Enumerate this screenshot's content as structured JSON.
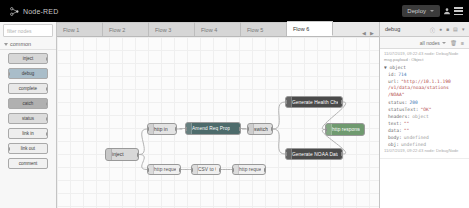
{
  "header": {
    "logo_text": "Node-RED",
    "logo_icon": "node-red-logo-icon",
    "deploy_label": "Deploy",
    "user_icon": "user-icon",
    "menu_icon": "hamburger-menu-icon",
    "background": "#000000"
  },
  "tabs": {
    "items": [
      {
        "label": "Flow 1",
        "active": false
      },
      {
        "label": "Flow 2",
        "active": false
      },
      {
        "label": "Flow 3",
        "active": false
      },
      {
        "label": "Flow 4",
        "active": false
      },
      {
        "label": "Flow 5",
        "active": false
      },
      {
        "label": "Flow 6",
        "active": true
      }
    ],
    "prev_arrow": "◀",
    "next_arrow": "▶"
  },
  "palette": {
    "search_placeholder": "filter nodes",
    "search_icon": "search-icon",
    "category": "common",
    "nodes": [
      {
        "label": "inject",
        "color": "#d7d7d7",
        "has_in": false,
        "has_out": true
      },
      {
        "label": "debug",
        "color": "#a9bdc9",
        "has_in": true,
        "has_out": false
      },
      {
        "label": "complete",
        "color": "#e8e8e8",
        "has_in": false,
        "has_out": true
      },
      {
        "label": "catch",
        "color": "#b0b0b0",
        "has_in": false,
        "has_out": true
      },
      {
        "label": "status",
        "color": "#dcdcdc",
        "has_in": false,
        "has_out": true
      },
      {
        "label": "link in",
        "color": "#eeeeee",
        "has_in": false,
        "has_out": true
      },
      {
        "label": "link out",
        "color": "#eeeeee",
        "has_in": true,
        "has_out": false
      },
      {
        "label": "comment",
        "color": "#f1f1f1",
        "has_in": false,
        "has_out": false
      }
    ]
  },
  "canvas": {
    "nodes": [
      {
        "id": "n1",
        "label": "inject",
        "x": 48,
        "y": 111,
        "w": 34,
        "h": 13,
        "color": "#d8d8d8",
        "text": "#333333",
        "in": false,
        "out": true
      },
      {
        "id": "n2",
        "label": "http in",
        "x": 90,
        "y": 86,
        "w": 30,
        "h": 12,
        "color": "#e3e3e3",
        "text": "#333333",
        "in": true,
        "out": true
      },
      {
        "id": "n3",
        "label": "Amend Req Prop",
        "x": 128,
        "y": 85,
        "w": 56,
        "h": 13,
        "color": "#4d6b6b",
        "text": "#ffffff",
        "in": true,
        "out": true
      },
      {
        "id": "n4",
        "label": "switch",
        "x": 190,
        "y": 86,
        "w": 26,
        "h": 12,
        "color": "#e0e0e0",
        "text": "#333333",
        "in": true,
        "out": true
      },
      {
        "id": "n5",
        "label": "Generate Health Check",
        "x": 228,
        "y": 59,
        "w": 58,
        "h": 12,
        "color": "#4a4a4a",
        "text": "#ffffff",
        "in": true,
        "out": true
      },
      {
        "id": "n6",
        "label": "Generate NOAA Dataset",
        "x": 228,
        "y": 111,
        "w": 58,
        "h": 12,
        "color": "#4a4a4a",
        "text": "#ffffff",
        "in": true,
        "out": true
      },
      {
        "id": "n7",
        "label": "http response",
        "x": 268,
        "y": 86,
        "w": 40,
        "h": 13,
        "color": "#6f9a6f",
        "text": "#ffffff",
        "in": true,
        "out": false
      },
      {
        "id": "n8",
        "label": "http request",
        "x": 90,
        "y": 127,
        "w": 34,
        "h": 11,
        "color": "#efefef",
        "text": "#555555",
        "in": true,
        "out": true
      },
      {
        "id": "n9",
        "label": "CSV to Obj",
        "x": 134,
        "y": 127,
        "w": 30,
        "h": 11,
        "color": "#efefef",
        "text": "#555555",
        "in": true,
        "out": true
      },
      {
        "id": "n10",
        "label": "http request",
        "x": 175,
        "y": 127,
        "w": 34,
        "h": 11,
        "color": "#efefef",
        "text": "#555555",
        "in": true,
        "out": true
      }
    ],
    "wires": [
      {
        "from": "n1",
        "to": "n2"
      },
      {
        "from": "n1",
        "to": "n8"
      },
      {
        "from": "n2",
        "to": "n3"
      },
      {
        "from": "n3",
        "to": "n4"
      },
      {
        "from": "n4",
        "to": "n5"
      },
      {
        "from": "n4",
        "to": "n6"
      },
      {
        "from": "n5",
        "to": "n7"
      },
      {
        "from": "n6",
        "to": "n7"
      },
      {
        "from": "n8",
        "to": "n9"
      },
      {
        "from": "n9",
        "to": "n10"
      }
    ]
  },
  "sidebar": {
    "tab_label": "debug",
    "tab_icons": [
      "info-icon",
      "debug-icon",
      "dashboard-icon",
      "config-icon",
      "more-icon"
    ],
    "toolbar": {
      "filter_label": "all nodes",
      "filter_icon": "chevron-down-icon",
      "clear_icon": "trash-icon",
      "collapse_icon": "collapse-icon"
    },
    "debug_messages": [
      {
        "timestamp": "11/07/2019, 09:22:43",
        "source_node": "node: DebugNode",
        "topic": "msg.payload : Object",
        "rows": [
          {
            "indent": 0,
            "key": "▼ object",
            "value": "",
            "type": "obj"
          },
          {
            "indent": 1,
            "key": "id:",
            "value": "714",
            "type": "num"
          },
          {
            "indent": 1,
            "key": "url:",
            "value": "\"http://10.1.1.190",
            "type": "str"
          },
          {
            "indent": 1,
            "key": "",
            "value": "/v1/data/noaa/stations",
            "type": "str"
          },
          {
            "indent": 1,
            "key": "",
            "value": "/NOAA\"",
            "type": "str"
          },
          {
            "indent": 1,
            "key": "status:",
            "value": "200",
            "type": "num"
          },
          {
            "indent": 1,
            "key": "statusText:",
            "value": "\"OK\"",
            "type": "str"
          },
          {
            "indent": 1,
            "key": "headers:",
            "value": "object",
            "type": "obj"
          },
          {
            "indent": 1,
            "key": "text:",
            "value": "\"\"",
            "type": "str"
          },
          {
            "indent": 1,
            "key": "data:",
            "value": "\"\"",
            "type": "str"
          },
          {
            "indent": 1,
            "key": "body:",
            "value": "undefined",
            "type": "obj"
          },
          {
            "indent": 1,
            "key": "obj:",
            "value": "undefined",
            "type": "obj"
          }
        ],
        "footer": "11/07/2019, 09:22:43  node: DebugNode"
      }
    ]
  }
}
